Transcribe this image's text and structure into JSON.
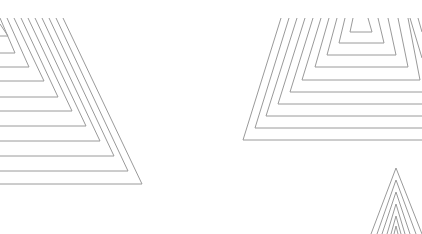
{
  "graphic": {
    "description": "Decorative line-art of nested triangular shapes",
    "stroke_color": "#9a9a9a",
    "background_color": "#ffffff",
    "shapes": [
      {
        "name": "top-left-nested-triangles",
        "count": 10
      },
      {
        "name": "top-right-nested-pyramid",
        "count": 9
      },
      {
        "name": "bottom-right-nested-chevrons",
        "count": 6
      }
    ]
  }
}
